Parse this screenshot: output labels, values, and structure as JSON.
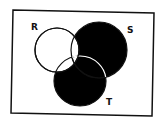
{
  "diagram": {
    "type": "venn",
    "sets": [
      "R",
      "S",
      "T"
    ],
    "labels": {
      "R": "R",
      "S": "S",
      "T": "T"
    },
    "shaded_regions": [
      "S only",
      "T only",
      "S∩T not R"
    ],
    "unshaded_regions": [
      "R only",
      "R∩S not T",
      "R∩T not S",
      "R∩S∩T"
    ],
    "shade_color": "#000000",
    "background_color": "#ffffff"
  }
}
